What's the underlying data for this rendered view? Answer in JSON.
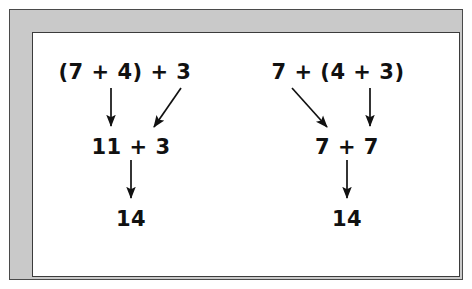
{
  "figure": {
    "frame": {
      "band_color": "#c9c9c9",
      "outline_color": "#3b3b3b",
      "interior_color": "#ffffff"
    },
    "text_color": "#111111"
  },
  "diagram": {
    "left_tree": {
      "name": "left-grouping",
      "expression": "(7 + 4) + 3",
      "intermediate": "11 + 3",
      "result": "14",
      "arrows": [
        {
          "name": "arrow-left-paren-to-11",
          "kind": "vertical",
          "from": "(7 + 4)",
          "to": "11"
        },
        {
          "name": "arrow-left-3-to-3",
          "kind": "diagonal-down-left",
          "from": "3",
          "to": "3"
        },
        {
          "name": "arrow-left-sum-to-14",
          "kind": "vertical",
          "from": "11 + 3",
          "to": "14"
        }
      ]
    },
    "right_tree": {
      "name": "right-grouping",
      "expression": "7 + (4 + 3)",
      "intermediate": "7 + 7",
      "result": "14",
      "arrows": [
        {
          "name": "arrow-right-7-to-7",
          "kind": "diagonal-down-right",
          "from": "7",
          "to": "7"
        },
        {
          "name": "arrow-right-paren-to-7",
          "kind": "vertical",
          "from": "(4 + 3)",
          "to": "7"
        },
        {
          "name": "arrow-right-sum-to-14",
          "kind": "vertical",
          "from": "7 + 7",
          "to": "14"
        }
      ]
    }
  }
}
